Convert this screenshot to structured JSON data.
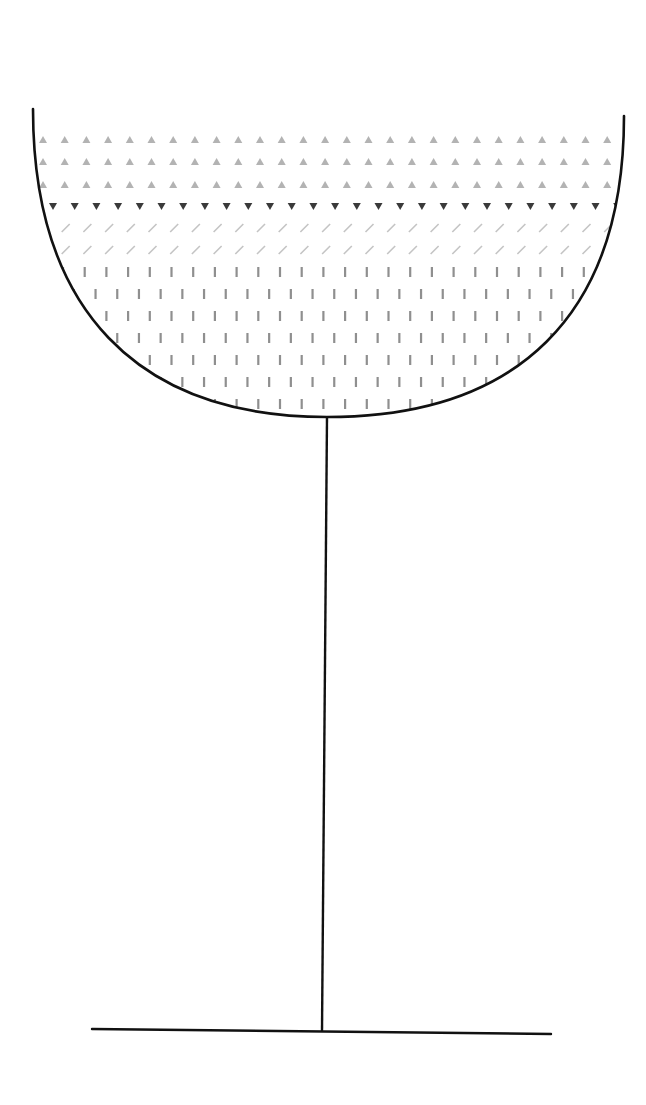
{
  "diagram": {
    "colors": {
      "outline": "#111111",
      "light_triangle": "#b3b3b3",
      "dark_triangle": "#3a3a3a",
      "slash": "#c4c4c4",
      "bar": "#8f8f8f",
      "background": "#ffffff"
    },
    "glass": {
      "bowl": {
        "left_rim": [
          33,
          109
        ],
        "right_rim": [
          624,
          116
        ],
        "bottom": [
          327,
          417
        ]
      },
      "stem": {
        "top": [
          327,
          417
        ],
        "bottom": [
          322,
          1031
        ]
      },
      "base": {
        "left": [
          92,
          1029
        ],
        "right": [
          551,
          1034
        ]
      }
    },
    "layers": [
      {
        "name": "top-layer",
        "pattern": "triangle-up",
        "color_key": "light_triangle",
        "rows_y": [
          140,
          162,
          185
        ],
        "x_start": 43,
        "x_step": 21.7,
        "offset_alternate": false
      },
      {
        "name": "boundary-layer",
        "pattern": "triangle-down",
        "color_key": "dark_triangle",
        "rows_y": [
          206
        ],
        "x_start": 53,
        "x_step": 21.7,
        "offset_alternate": false
      },
      {
        "name": "middle-layer",
        "pattern": "slash",
        "color_key": "slash",
        "rows_y": [
          228,
          250
        ],
        "x_start": 44,
        "x_step": 21.7,
        "offset_alternate": false
      },
      {
        "name": "bottom-layer",
        "pattern": "vertical-bar",
        "color_key": "bar",
        "rows_y": [
          272,
          294,
          316,
          338,
          360,
          382,
          404
        ],
        "x_start": 63,
        "x_step": 21.7,
        "offset_alternate": true
      }
    ]
  }
}
